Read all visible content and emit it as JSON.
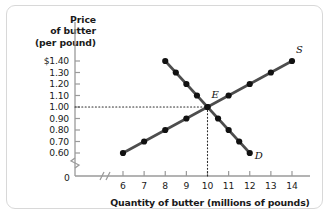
{
  "figure": {
    "y_axis_title_lines": [
      "Price",
      "of butter",
      "(per pound)"
    ],
    "x_axis_title": "Quantity of butter (millions of pounds)",
    "origin_label": "0",
    "equilibrium_label": "E",
    "supply_label": "S",
    "demand_label": "D",
    "line_color": "#4d4d4d",
    "point_color": "#111111",
    "axis_color": "#9a9a9a",
    "guide_color": "#2b2b2b",
    "frame_color": "#d8d8d8"
  },
  "chart_data": {
    "type": "line",
    "title": "",
    "xlabel": "Quantity of butter (millions of pounds)",
    "ylabel": "Price of butter (per pound)",
    "xlim": [
      5.3,
      14.8
    ],
    "ylim": [
      0.55,
      1.45
    ],
    "xticks": [
      6,
      7,
      8,
      9,
      10,
      11,
      12,
      13,
      14
    ],
    "xtick_labels": [
      "6",
      "7",
      "8",
      "9",
      "10",
      "11",
      "12",
      "13",
      "14"
    ],
    "yticks": [
      0.6,
      0.7,
      0.8,
      0.9,
      1.0,
      1.1,
      1.2,
      1.3,
      1.4
    ],
    "ytick_labels": [
      "0.60",
      "0.70",
      "0.80",
      "0.90",
      "1.00",
      "1.10",
      "1.20",
      "1.30",
      "$1.40"
    ],
    "grid": false,
    "legend": "none",
    "axis_breaks": {
      "x": "//",
      "y": "zigzag"
    },
    "series": [
      {
        "name": "S",
        "label": "S",
        "description": "Supply curve",
        "x": [
          6,
          7,
          8,
          9,
          10,
          11,
          12,
          13,
          14
        ],
        "y": [
          0.6,
          0.7,
          0.8,
          0.9,
          1.0,
          1.1,
          1.2,
          1.3,
          1.4
        ]
      },
      {
        "name": "D",
        "label": "D",
        "description": "Demand curve",
        "x": [
          8,
          8.5,
          9,
          9.5,
          10,
          10.5,
          11,
          11.5,
          12
        ],
        "y": [
          1.4,
          1.3,
          1.2,
          1.1,
          1.0,
          0.9,
          0.8,
          0.7,
          0.6
        ]
      }
    ],
    "annotations": [
      {
        "label": "E",
        "description": "Equilibrium point",
        "x": 10,
        "y": 1.0,
        "guides": [
          "horizontal dotted to y-axis",
          "vertical dotted to x-axis"
        ]
      }
    ]
  }
}
